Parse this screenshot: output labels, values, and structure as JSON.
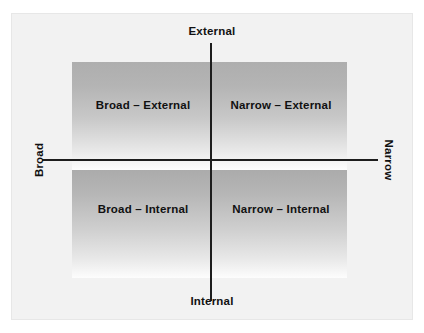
{
  "chart_data": {
    "type": "scatter",
    "title": "",
    "subtitle": "",
    "xlabel": "",
    "ylabel": "",
    "grid": false,
    "legend_position": "none",
    "axis_labels": {
      "top": "External",
      "bottom": "Internal",
      "left": "Broad",
      "right": "Narrow"
    },
    "axes": [
      {
        "name": "horizontal",
        "low_end": "Broad",
        "high_end": "Narrow"
      },
      {
        "name": "vertical",
        "low_end": "Internal",
        "high_end": "External"
      }
    ],
    "quadrants": [
      {
        "position": "top-left",
        "label": "Broad – External"
      },
      {
        "position": "top-right",
        "label": "Narrow – External"
      },
      {
        "position": "bottom-left",
        "label": "Broad – Internal"
      },
      {
        "position": "bottom-right",
        "label": "Narrow – Internal"
      }
    ],
    "values": [],
    "colors": {
      "axis": "#1d1d1d",
      "text": "#111111",
      "frame_background": "#f2f2f2",
      "frame_border": "#e7e7e7",
      "gradient_dark": "#aeaeae",
      "gradient_light": "#ffffff",
      "page_background": "#ffffff"
    }
  },
  "diagram": {
    "axis_labels": {
      "top": "External",
      "bottom": "Internal",
      "left": "Broad",
      "right": "Narrow"
    },
    "quadrants": {
      "top_left": "Broad – External",
      "top_right": "Narrow – External",
      "bottom_left": "Broad – Internal",
      "bottom_right": "Narrow – Internal"
    }
  }
}
